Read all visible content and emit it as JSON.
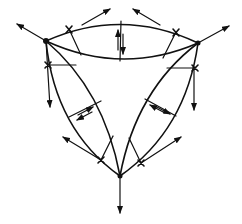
{
  "diagram": {
    "title": "",
    "colors": {
      "line": "#111111",
      "background": "#ffffff"
    },
    "vertices": [
      {
        "id": "A",
        "name": "top-left-vertex",
        "x": 46,
        "y": 41
      },
      {
        "id": "B",
        "name": "top-right-vertex",
        "x": 198,
        "y": 43
      },
      {
        "id": "C",
        "name": "bottom-vertex",
        "x": 120,
        "y": 176
      }
    ],
    "edges": [
      {
        "from": "A",
        "to": "B",
        "outer_bulge": "up",
        "inner_bulge": "down"
      },
      {
        "from": "A",
        "to": "C",
        "outer_bulge": "left",
        "inner_bulge": "right"
      },
      {
        "from": "B",
        "to": "C",
        "outer_bulge": "right",
        "inner_bulge": "left"
      }
    ],
    "arrows": [
      {
        "name": "vertex-a-outward-arrow",
        "from": [
          46,
          41
        ],
        "to": [
          16,
          23
        ]
      },
      {
        "name": "vertex-a-down-arrow",
        "from": [
          46,
          41
        ],
        "to": [
          50,
          108
        ]
      },
      {
        "name": "vertex-b-outward-arrow",
        "from": [
          198,
          43
        ],
        "to": [
          230,
          25
        ]
      },
      {
        "name": "vertex-b-down-arrow",
        "from": [
          198,
          43
        ],
        "to": [
          194,
          111
        ]
      },
      {
        "name": "vertex-c-down-arrow",
        "from": [
          120,
          176
        ],
        "to": [
          120,
          214
        ]
      },
      {
        "name": "top-edge-left-arrow",
        "from": [
          82,
          25
        ],
        "to": [
          110,
          9
        ]
      },
      {
        "name": "top-edge-right-arrow",
        "from": [
          160,
          25
        ],
        "to": [
          133,
          9
        ]
      },
      {
        "name": "bottom-left-arrow",
        "from": [
          101,
          160
        ],
        "to": [
          62,
          137
        ]
      },
      {
        "name": "bottom-right-arrow",
        "from": [
          150,
          150
        ],
        "to": [
          181,
          136
        ]
      }
    ],
    "labels": []
  }
}
